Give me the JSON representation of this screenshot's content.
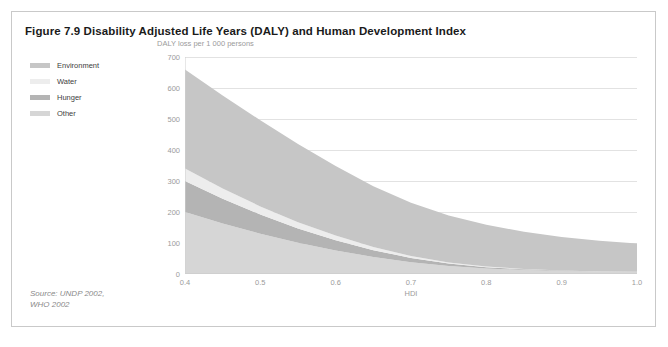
{
  "figure": {
    "title": "Figure 7.9 Disability Adjusted Life Years (DALY) and Human Development Index",
    "source": "Source: UNDP 2002,\nWHO 2002"
  },
  "legend": {
    "items": [
      {
        "label": "Environment",
        "color": "#c6c6c6"
      },
      {
        "label": "Water",
        "color": "#ededed"
      },
      {
        "label": "Hunger",
        "color": "#b4b4b4"
      },
      {
        "label": "Other",
        "color": "#d6d6d6"
      }
    ]
  },
  "chart_data": {
    "type": "area",
    "stacked": true,
    "title": "Figure 7.9 Disability Adjusted Life Years (DALY) and Human Development Index",
    "xlabel": "HDI",
    "ylabel": "DALY loss per 1 000 persons",
    "xlim": [
      0.4,
      1.0
    ],
    "ylim": [
      0,
      700
    ],
    "xticks": [
      "0.4",
      "0.5",
      "0.6",
      "0.7",
      "0.8",
      "0.9",
      "1.0"
    ],
    "xtick_values": [
      0.4,
      0.5,
      0.6,
      0.7,
      0.8,
      0.9,
      1.0
    ],
    "yticks": [
      "0",
      "100",
      "200",
      "300",
      "400",
      "500",
      "600",
      "700"
    ],
    "ytick_values": [
      0,
      100,
      200,
      300,
      400,
      500,
      600,
      700
    ],
    "grid": "horizontal",
    "legend_position": "outside-left",
    "x": [
      0.4,
      0.45,
      0.5,
      0.55,
      0.6,
      0.65,
      0.7,
      0.75,
      0.8,
      0.85,
      0.9,
      0.95,
      1.0
    ],
    "series": [
      {
        "name": "Other",
        "color": "#d6d6d6",
        "values": [
          200,
          163,
          130,
          101,
          76,
          55,
          38,
          26,
          18,
          13,
          10,
          8,
          7
        ]
      },
      {
        "name": "Hunger",
        "color": "#b4b4b4",
        "values": [
          100,
          80,
          62,
          46,
          33,
          22,
          14,
          8,
          4,
          2,
          1,
          0,
          0
        ]
      },
      {
        "name": "Water",
        "color": "#ededed",
        "values": [
          40,
          33,
          26,
          20,
          15,
          10,
          6,
          3,
          2,
          1,
          0,
          0,
          0
        ]
      },
      {
        "name": "Environment",
        "color": "#c6c6c6",
        "values": [
          320,
          300,
          278,
          252,
          224,
          196,
          172,
          152,
          135,
          120,
          108,
          99,
          91
        ]
      }
    ],
    "totals": [
      660,
      576,
      496,
      419,
      348,
      283,
      230,
      189,
      159,
      136,
      119,
      107,
      98
    ]
  }
}
